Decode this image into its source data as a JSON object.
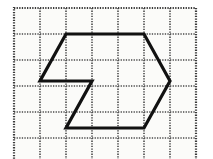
{
  "figure": {
    "canvas": {
      "width": 213,
      "height": 159,
      "background": "#ffffff"
    },
    "grid": {
      "origin_x": 14,
      "origin_y": 8,
      "cell_size": 26,
      "cols": 7,
      "rows": 6,
      "line_color": "#4a4a4a",
      "line_style": "dotted",
      "line_width": 1.6,
      "dash_pattern": "1.3 1.3",
      "border_color": "#3a3a3a",
      "border_width": 2.2,
      "interior_fill": "#fbfbf9"
    },
    "shape": {
      "name": "hexagon-with-z-notch",
      "stroke_color": "#111111",
      "stroke_width": 3.2,
      "fill": "none",
      "line_join": "miter",
      "line_cap": "butt",
      "outline_points": "66,34 144,34 170,81 144,128 66,128 92,81 40,81",
      "closed": true,
      "vertices": [
        {
          "label": "top-left",
          "grid_col": 2,
          "grid_row": 1,
          "x": 66,
          "y": 34
        },
        {
          "label": "top-right",
          "grid_col": 5,
          "grid_row": 1,
          "x": 144,
          "y": 34
        },
        {
          "label": "right-point",
          "grid_col": 6,
          "grid_row": 3,
          "x": 170,
          "y": 81
        },
        {
          "label": "bottom-right",
          "grid_col": 5,
          "grid_row": 5,
          "x": 144,
          "y": 128
        },
        {
          "label": "bottom-left",
          "grid_col": 2,
          "grid_row": 5,
          "x": 66,
          "y": 128
        },
        {
          "label": "notch-inner",
          "grid_col": 3,
          "grid_row": 3,
          "x": 92,
          "y": 81
        },
        {
          "label": "left-point",
          "grid_col": 1,
          "grid_row": 3,
          "x": 40,
          "y": 81
        }
      ],
      "segments": [
        {
          "name": "top-edge",
          "from": "top-left",
          "to": "top-right",
          "orientation": "horizontal"
        },
        {
          "name": "upper-right-diagonal",
          "from": "top-right",
          "to": "right-point",
          "orientation": "diagonal"
        },
        {
          "name": "lower-right-diagonal",
          "from": "right-point",
          "to": "bottom-right",
          "orientation": "diagonal"
        },
        {
          "name": "bottom-edge",
          "from": "bottom-right",
          "to": "bottom-left",
          "orientation": "horizontal"
        },
        {
          "name": "z-diagonal",
          "from": "bottom-left",
          "to": "notch-inner",
          "orientation": "diagonal"
        },
        {
          "name": "middle-edge",
          "from": "notch-inner",
          "to": "left-point",
          "orientation": "horizontal"
        },
        {
          "name": "upper-left-diagonal",
          "from": "left-point",
          "to": "top-left",
          "orientation": "diagonal"
        }
      ]
    }
  }
}
